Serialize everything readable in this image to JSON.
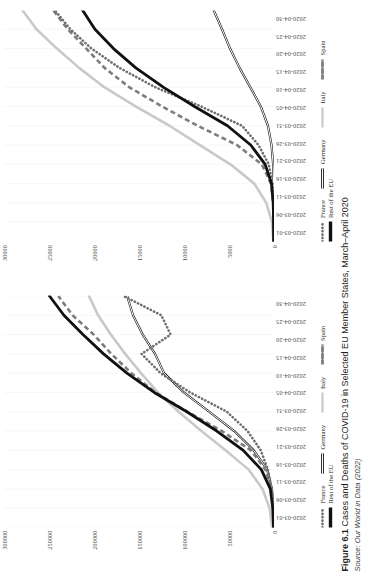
{
  "figure": {
    "label": "Figure 6.1",
    "caption": "Cases and Deaths of COVID-19 in Selected EU Member States, March–April 2020",
    "source": "Source: Our World in Data (2022)"
  },
  "colors": {
    "france": "#6e6e6e",
    "germany": "#a8a8a8",
    "italy": "#c9c9c9",
    "spain": "#7d7d7d",
    "rest_of_eu": "#111111",
    "gridline": "#e8e8e8",
    "text": "#4a4a4a"
  },
  "legend": {
    "items": [
      {
        "label": "France",
        "style": "dotted",
        "color": "#6e6e6e"
      },
      {
        "label": "Germany",
        "style": "thin-double",
        "color": "#9a9a9a"
      },
      {
        "label": "Italy",
        "style": "solid-light",
        "color": "#c9c9c9"
      },
      {
        "label": "Spain",
        "style": "dashed",
        "color": "#7d7d7d"
      },
      {
        "label": "Rest of the EU",
        "style": "solid-thick",
        "color": "#111111"
      }
    ]
  },
  "chart_data": [
    {
      "id": "cases",
      "type": "line",
      "title": "",
      "xlabel": "",
      "ylabel": "",
      "grid": true,
      "legend_position": "bottom",
      "ylim": [
        0,
        300000
      ],
      "yticks": [
        0,
        50000,
        100000,
        150000,
        200000,
        250000,
        300000
      ],
      "ytick_labels": [
        "0",
        "50000",
        "100000",
        "150000",
        "200000",
        "250000",
        "300000"
      ],
      "x": [
        "2020-03-01",
        "2020-03-06",
        "2020-03-11",
        "2020-03-16",
        "2020-03-21",
        "2020-03-26",
        "2020-03-31",
        "2020-04-05",
        "2020-04-10",
        "2020-04-15",
        "2020-04-20",
        "2020-04-25",
        "2020-04-30"
      ],
      "series": [
        {
          "name": "France",
          "values": [
            0,
            700,
            2300,
            6600,
            14400,
            29200,
            52100,
            93000,
            125900,
            147000,
            114700,
            125000,
            167000
          ]
        },
        {
          "name": "Germany",
          "values": [
            0,
            700,
            2000,
            7300,
            22200,
            43900,
            71800,
            100000,
            122000,
            132000,
            145700,
            156500,
            163000
          ]
        },
        {
          "name": "Italy",
          "values": [
            1700,
            4600,
            12500,
            27900,
            53600,
            80500,
            105800,
            128900,
            147600,
            165200,
            181200,
            195400,
            205500
          ]
        },
        {
          "name": "Spain",
          "values": [
            0,
            400,
            2300,
            9200,
            25400,
            57700,
            95900,
            131600,
            158300,
            180700,
            200200,
            223700,
            239600
          ]
        },
        {
          "name": "Rest of the EU",
          "values": [
            200,
            1100,
            3800,
            13800,
            33900,
            63300,
            96700,
            132900,
            163300,
            189300,
            212200,
            233400,
            249400
          ]
        }
      ]
    },
    {
      "id": "deaths",
      "type": "line",
      "title": "",
      "xlabel": "",
      "ylabel": "",
      "grid": true,
      "legend_position": "bottom",
      "ylim": [
        0,
        30000
      ],
      "yticks": [
        0,
        5000,
        10000,
        15000,
        20000,
        25000,
        30000
      ],
      "ytick_labels": [
        "0",
        "5000",
        "10000",
        "15000",
        "20000",
        "25000",
        "30000"
      ],
      "x": [
        "2020-03-01",
        "2020-03-06",
        "2020-03-11",
        "2020-03-16",
        "2020-03-21",
        "2020-03-26",
        "2020-03-31",
        "2020-04-05",
        "2020-04-10",
        "2020-04-15",
        "2020-04-20",
        "2020-04-25",
        "2020-04-30"
      ],
      "series": [
        {
          "name": "France",
          "values": [
            0,
            9,
            48,
            148,
            562,
            1696,
            3523,
            8078,
            13197,
            17167,
            20265,
            22614,
            24376
          ]
        },
        {
          "name": "Germany",
          "values": [
            0,
            0,
            3,
            17,
            68,
            253,
            645,
            1444,
            2607,
            3804,
            4862,
            5750,
            6692
          ]
        },
        {
          "name": "Italy",
          "values": [
            41,
            197,
            827,
            2158,
            4825,
            8215,
            11591,
            15362,
            18849,
            21645,
            24114,
            26384,
            27967
          ]
        },
        {
          "name": "Spain",
          "values": [
            0,
            5,
            48,
            309,
            1326,
            4089,
            8464,
            12418,
            16081,
            18812,
            20852,
            22902,
            24543
          ]
        },
        {
          "name": "Rest of the EU",
          "values": [
            2,
            16,
            62,
            253,
            956,
            2561,
            5151,
            8815,
            12292,
            15340,
            17823,
            19885,
            21276
          ]
        }
      ]
    }
  ]
}
